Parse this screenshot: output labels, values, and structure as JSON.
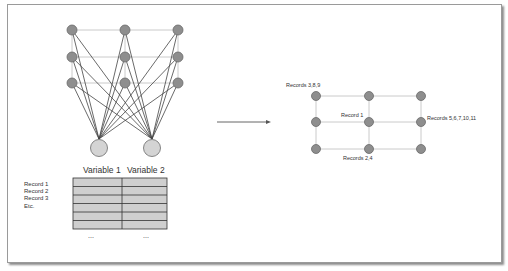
{
  "diagram": {
    "colors": {
      "node_fill": "#8e8e8e",
      "node_stroke": "#6a6a6a",
      "input_node_fill": "#d4d4d4",
      "table_fill": "#cfcfcf",
      "line": "#444444",
      "grid_line": "#bdbdbd"
    },
    "network": {
      "output_nodes_grid": "3x3",
      "input_nodes": 2
    },
    "table": {
      "headers": [
        "Variable 1",
        "Variable 2"
      ],
      "row_labels": [
        "Record 1",
        "Record 2",
        "Record 3",
        "Etc."
      ],
      "rows": 6,
      "ellipsis": [
        "...",
        "..."
      ]
    },
    "arrow": {
      "direction": "right"
    },
    "map": {
      "grid": "3x3",
      "labels": {
        "top_left": "Records 3,8,9",
        "center": "Record 1",
        "middle_right": "Records 5,6,7,10,11",
        "bottom_center": "Records 2,4"
      }
    }
  }
}
